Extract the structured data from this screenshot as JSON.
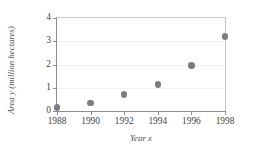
{
  "chart_data": {
    "type": "scatter",
    "title": "",
    "xlabel": "Year x",
    "ylabel": "Area y  (million hectares)",
    "x": [
      1988,
      1990,
      1992,
      1994,
      1996,
      1998
    ],
    "values": [
      0.15,
      0.35,
      0.7,
      1.15,
      1.95,
      3.2
    ],
    "xlim": [
      1988,
      1998
    ],
    "ylim": [
      0,
      4
    ],
    "xticks": [
      1988,
      1990,
      1992,
      1994,
      1996,
      1998
    ],
    "xtick_labels": [
      "1988",
      "1990",
      "1992",
      "1994",
      "1996",
      "1998"
    ],
    "yticks": [
      0,
      1,
      2,
      3,
      4
    ],
    "ytick_labels": [
      "0",
      "1",
      "2",
      "3",
      "4"
    ],
    "grid": "horizontal",
    "legend": "none",
    "marker_color": "#7d7d7d",
    "axis_color": "#8f8f8f",
    "gridline_color": "#efefef",
    "frame_color": "#c9c9c9"
  }
}
